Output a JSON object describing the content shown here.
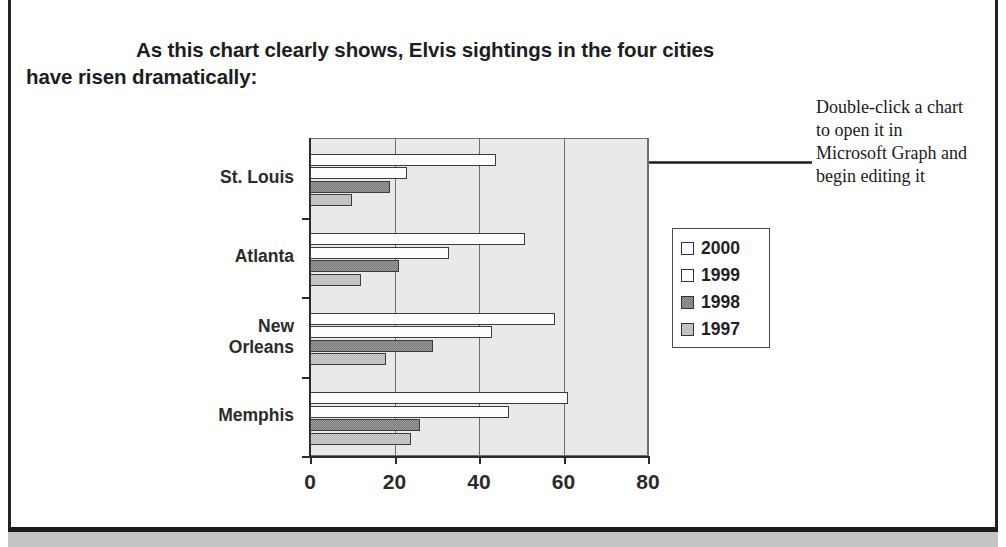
{
  "document": {
    "heading_line1": "As this chart clearly shows, Elvis sightings in the four cities",
    "heading_line2": "have risen dramatically:"
  },
  "callout": {
    "text": "Double-click a chart to open it in Microsoft Graph and begin editing it",
    "arrow_icon": "left-arrow-icon"
  },
  "chart_data": {
    "type": "bar",
    "orientation": "horizontal",
    "title": "",
    "xlabel": "",
    "ylabel": "",
    "categories": [
      "St. Louis",
      "Atlanta",
      "New Orleans",
      "Memphis"
    ],
    "series": [
      {
        "name": "2000",
        "color": "#fdfdfd",
        "values": [
          44,
          51,
          58,
          61
        ]
      },
      {
        "name": "1999",
        "color": "#fdfdfd",
        "values": [
          23,
          33,
          43,
          47
        ]
      },
      {
        "name": "1998",
        "color": "#757575",
        "values": [
          19,
          21,
          29,
          26
        ]
      },
      {
        "name": "1997",
        "color": "#b6b6b6",
        "values": [
          10,
          12,
          18,
          24
        ]
      }
    ],
    "xlim": [
      0,
      80
    ],
    "xticks": [
      0,
      20,
      40,
      60,
      80
    ],
    "xtick_labels": [
      "0",
      "20",
      "40",
      "60",
      "80"
    ],
    "grid": true,
    "legend_position": "right",
    "plot_background": "#e9e9e9"
  },
  "legend": {
    "entries": [
      {
        "label": "2000",
        "swatch": "#fdfdfd"
      },
      {
        "label": "1999",
        "swatch": "#fdfdfd"
      },
      {
        "label": "1998",
        "swatch": "#757575"
      },
      {
        "label": "1997",
        "swatch": "#b6b6b6"
      }
    ]
  }
}
